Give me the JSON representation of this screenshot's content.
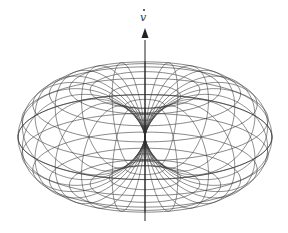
{
  "figure": {
    "axis_label": "v",
    "axis_label_has_dot": true,
    "pattern": "sin^2(theta)",
    "parallels": 22,
    "meridians": 24,
    "line_color": "#3a3a3a",
    "background": "#ffffff"
  }
}
